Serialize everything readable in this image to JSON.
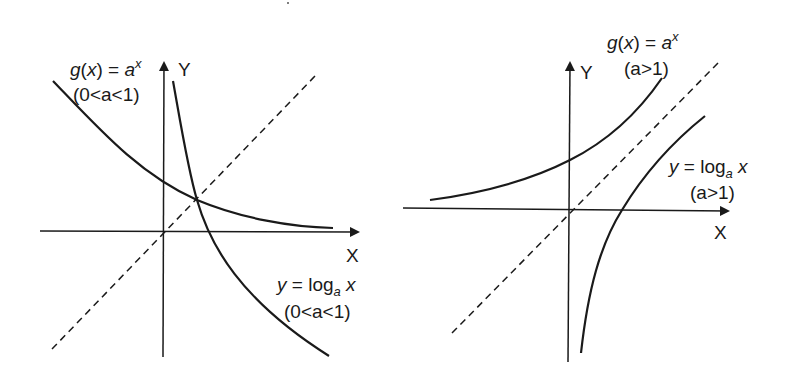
{
  "diagram": {
    "colors": {
      "stroke": "#1a1a1a",
      "background": "#ffffff"
    },
    "left_graph": {
      "case": "0<a<1",
      "y_axis_label": "Y",
      "x_axis_label": "X",
      "exp_curve": {
        "label_func": "g",
        "label_arg": "x",
        "label_eq": "=",
        "label_base": "a",
        "label_exp": "x",
        "condition": "(0<a<1)"
      },
      "log_curve": {
        "label_y": "y",
        "label_eq": "=",
        "label_log": "log",
        "label_sub": "a",
        "label_arg": "x",
        "condition": "(0<a<1)"
      },
      "mirror_line": "y = x (dashed)"
    },
    "right_graph": {
      "case": "a>1",
      "y_axis_label": "Y",
      "x_axis_label": "X",
      "exp_curve": {
        "label_func": "g",
        "label_arg": "x",
        "label_eq": "=",
        "label_base": "a",
        "label_exp": "x",
        "condition": "(a>1)"
      },
      "log_curve": {
        "label_y": "y",
        "label_eq": "=",
        "label_log": "log",
        "label_sub": "a",
        "label_arg": "x",
        "condition": "(a>1)"
      },
      "mirror_line": "y = x (dashed)"
    }
  }
}
